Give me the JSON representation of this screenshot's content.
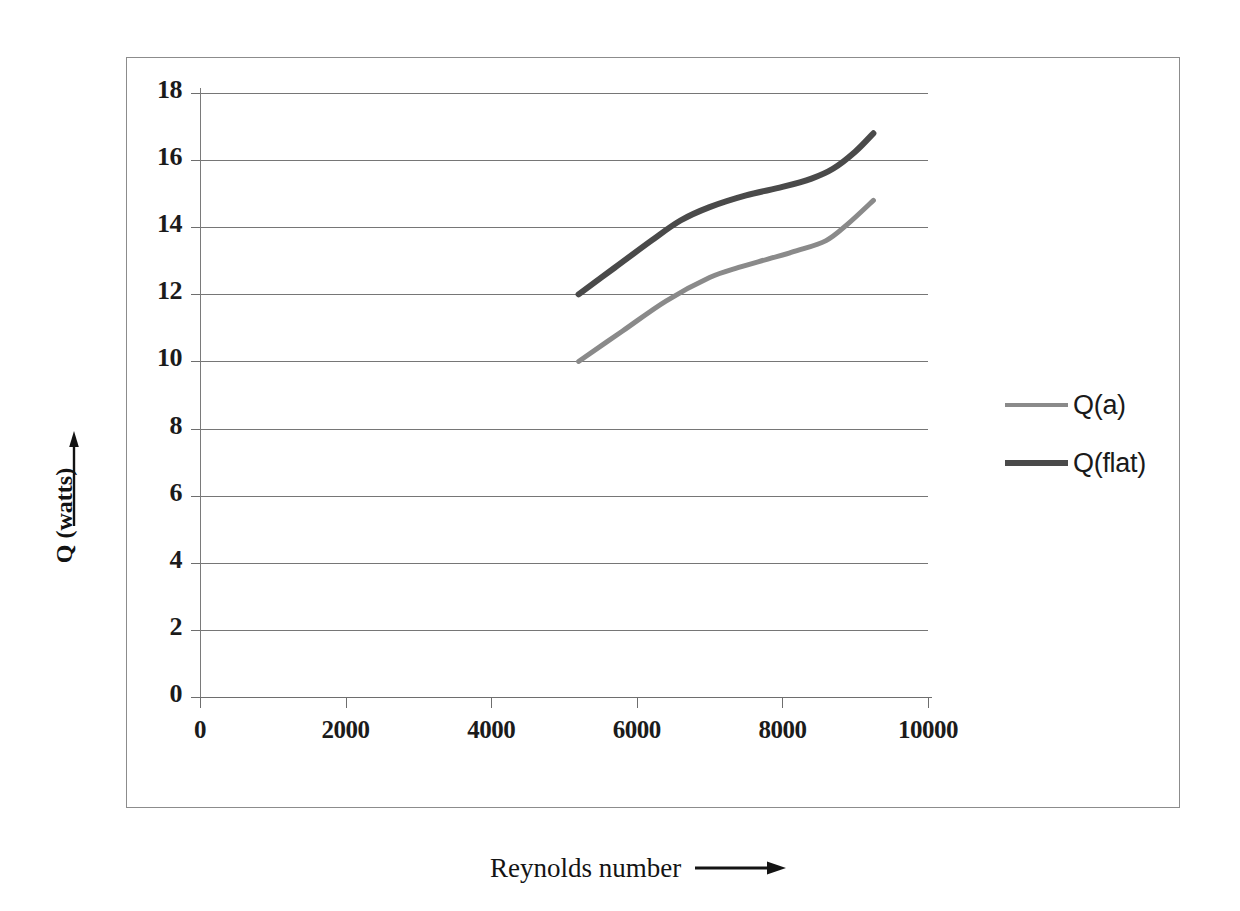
{
  "chart_data": {
    "type": "line",
    "title": "",
    "xlabel": "Reynolds number",
    "ylabel": "Q (watts)",
    "xlim": [
      0,
      10000
    ],
    "ylim": [
      0,
      18
    ],
    "grid": "horizontal",
    "legend_position": "right",
    "x_ticks": [
      "0",
      "2000",
      "4000",
      "6000",
      "8000",
      "10000"
    ],
    "x_tick_values": [
      0,
      2000,
      4000,
      6000,
      8000,
      10000
    ],
    "y_ticks": [
      "0",
      "2",
      "4",
      "6",
      "8",
      "10",
      "12",
      "14",
      "16",
      "18"
    ],
    "y_tick_values": [
      0,
      2,
      4,
      6,
      8,
      10,
      12,
      14,
      16,
      18
    ],
    "series": [
      {
        "name": "Q(a)",
        "color": "#8a8a8a",
        "line_width": 5,
        "x": [
          5200,
          5800,
          6400,
          7000,
          7400,
          7800,
          8200,
          8600,
          8900,
          9250
        ],
        "y": [
          10.0,
          10.9,
          11.8,
          12.5,
          12.8,
          13.05,
          13.3,
          13.6,
          14.1,
          14.8
        ]
      },
      {
        "name": "Q(flat)",
        "color": "#4a4a4a",
        "line_width": 6,
        "x": [
          5200,
          5700,
          6200,
          6600,
          7000,
          7500,
          8000,
          8400,
          8700,
          9000,
          9250
        ],
        "y": [
          12.0,
          12.8,
          13.6,
          14.2,
          14.6,
          14.95,
          15.2,
          15.45,
          15.75,
          16.25,
          16.8
        ]
      }
    ]
  },
  "legend": {
    "items": [
      {
        "label": "Q(a)",
        "color": "#8a8a8a"
      },
      {
        "label": "Q(flat)",
        "color": "#4a4a4a"
      }
    ]
  },
  "axes": {
    "y_title": "Q (watts)",
    "x_title": "Reynolds number",
    "y_arrow_icon": "arrow-up-icon",
    "x_arrow_icon": "arrow-right-icon"
  },
  "colors": {
    "gridline": "#767676",
    "axis": "#6e6e6e",
    "frame": "#8c8c8c",
    "text": "#1b1b1b",
    "series_light": "#8a8a8a",
    "series_dark": "#4a4a4a"
  }
}
